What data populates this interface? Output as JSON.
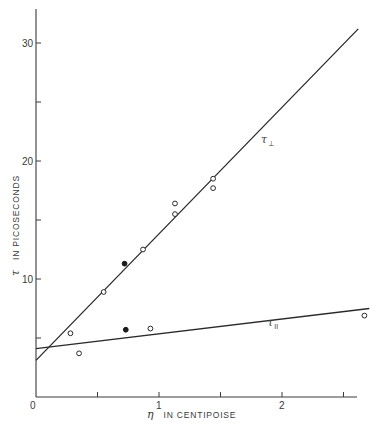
{
  "chart_data": {
    "type": "scatter",
    "title": "",
    "xlabel": "η IN CENTIPOISE",
    "xlabel_symbol": "η",
    "xlabel_text": "IN CENTIPOISE",
    "ylabel": "τ IN PICOSECONDS",
    "ylabel_symbol": "τ",
    "ylabel_text": "IN PICOSECONDS",
    "xlim": [
      0,
      2.62
    ],
    "ylim": [
      0,
      33
    ],
    "grid": false,
    "x_ticks": [
      0,
      0.5,
      1,
      1.5,
      2,
      2.5
    ],
    "x_tick_labels": [
      "0",
      "",
      "1",
      "",
      "2",
      ""
    ],
    "y_ticks": [
      5,
      10,
      15,
      20,
      25,
      30
    ],
    "y_tick_labels": [
      "",
      "10",
      "",
      "20",
      "",
      "30"
    ],
    "series": [
      {
        "name": "τ⊥",
        "label_symbol": "τ",
        "label_sub": "⊥",
        "fit_line": {
          "x": [
            0,
            2.62
          ],
          "y": [
            3.1,
            31.2
          ]
        },
        "label_pos": {
          "x": 1.83,
          "y": 21.5
        },
        "points": [
          {
            "x": 0.28,
            "y": 5.4,
            "marker": "open"
          },
          {
            "x": 0.55,
            "y": 8.9,
            "marker": "open"
          },
          {
            "x": 0.72,
            "y": 11.3,
            "marker": "filled"
          },
          {
            "x": 0.87,
            "y": 12.5,
            "marker": "open"
          },
          {
            "x": 1.13,
            "y": 16.4,
            "marker": "open"
          },
          {
            "x": 1.13,
            "y": 15.5,
            "marker": "open"
          },
          {
            "x": 1.44,
            "y": 18.5,
            "marker": "open"
          },
          {
            "x": 1.44,
            "y": 17.7,
            "marker": "open"
          }
        ]
      },
      {
        "name": "τ∥",
        "label_symbol": "τ",
        "label_sub": "II",
        "fit_line": {
          "x": [
            0,
            2.71
          ],
          "y": [
            4.1,
            7.5
          ]
        },
        "label_pos": {
          "x": 1.88,
          "y": 6.0
        },
        "points": [
          {
            "x": 0.35,
            "y": 3.7,
            "marker": "open"
          },
          {
            "x": 0.73,
            "y": 5.7,
            "marker": "filled"
          },
          {
            "x": 0.93,
            "y": 5.8,
            "marker": "open"
          },
          {
            "x": 2.67,
            "y": 6.9,
            "marker": "open"
          }
        ]
      }
    ]
  }
}
